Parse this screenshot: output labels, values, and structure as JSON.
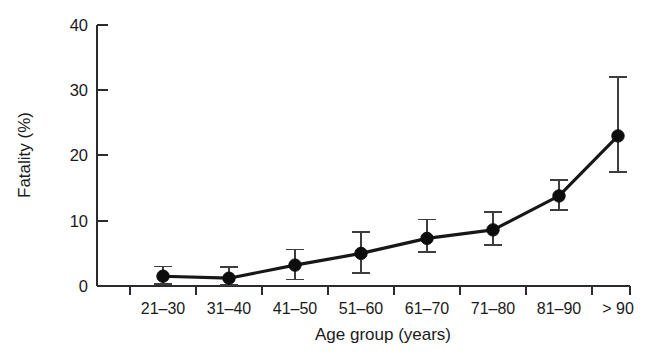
{
  "figure": {
    "background_color": "#ffffff",
    "line_color": "#171717",
    "marker_color": "#0d0d0d",
    "error_color": "#3d3d3d",
    "axis_color": "#2b2b2b"
  },
  "chart_data": {
    "type": "line",
    "title": "",
    "xlabel": "Age group (years)",
    "ylabel": "Fatality (%)",
    "categories": [
      "21–30",
      "31–40",
      "41–50",
      "51–60",
      "61–70",
      "71–80",
      "81–90",
      "> 90"
    ],
    "values": [
      1.5,
      1.2,
      3.2,
      5.0,
      7.3,
      8.6,
      13.8,
      23.0
    ],
    "error_low": [
      0.3,
      0.2,
      1.0,
      2.0,
      5.2,
      6.3,
      11.6,
      17.5
    ],
    "error_high": [
      3.0,
      2.9,
      5.6,
      8.3,
      10.2,
      11.4,
      16.2,
      32.0
    ],
    "ylim": [
      0,
      40
    ],
    "yticks": [
      0,
      10,
      20,
      30,
      40
    ],
    "ytick_labels": [
      "0",
      "10",
      "20",
      "30",
      "40"
    ],
    "xtick_labels": [
      "21–30",
      "31–40",
      "41–50",
      "51–60",
      "61–70",
      "71–80",
      "81–90",
      "> 90"
    ],
    "grid": false,
    "legend": null,
    "marker": "filled-circle",
    "error_style": "capped-vertical-bars"
  }
}
